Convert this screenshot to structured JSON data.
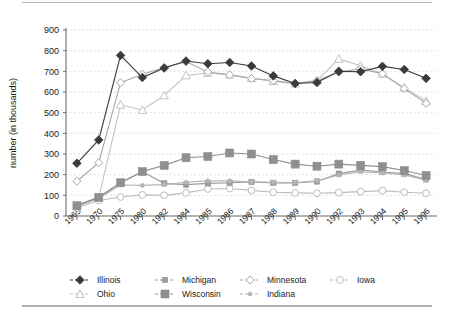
{
  "chart_data": {
    "type": "line",
    "title": "",
    "subtitle": "",
    "xlabel": "",
    "ylabel": "number (in thousands)",
    "ylim": [
      0,
      900
    ],
    "ytick_step": 100,
    "yticks": [
      0,
      100,
      200,
      300,
      400,
      500,
      600,
      700,
      800,
      900
    ],
    "grid": true,
    "grid_style": "dotted-horizontal",
    "legend_position": "bottom",
    "legend_columns": 4,
    "categories": [
      "1965",
      "1970",
      "1975",
      "1980",
      "1982",
      "1984",
      "1985",
      "1986",
      "1987",
      "1988",
      "1989",
      "1990",
      "1992",
      "1993",
      "1994",
      "1995",
      "1996"
    ],
    "series": [
      {
        "name": "Illinois",
        "marker": "filled-diamond",
        "color": "#3a3a3a",
        "values": [
          255,
          368,
          777,
          670,
          716,
          750,
          737,
          743,
          726,
          678,
          641,
          646,
          700,
          698,
          724,
          709,
          666
        ]
      },
      {
        "name": "Michigan",
        "marker": "small-filled-square",
        "color": "#9a9a9a",
        "values": [
          52,
          92,
          160,
          215,
          158,
          152,
          158,
          161,
          165,
          160,
          160,
          167,
          205,
          222,
          213,
          205,
          178
        ]
      },
      {
        "name": "Minnesota",
        "marker": "open-diamond",
        "color": "#a8a8a8",
        "values": [
          168,
          258,
          645,
          686,
          718,
          747,
          697,
          683,
          665,
          655,
          642,
          655,
          696,
          712,
          688,
          617,
          545
        ]
      },
      {
        "name": "Iowa",
        "marker": "open-circle",
        "color": "#bdbdbd",
        "values": [
          40,
          75,
          92,
          102,
          100,
          112,
          131,
          133,
          124,
          115,
          112,
          110,
          113,
          118,
          123,
          115,
          110
        ]
      },
      {
        "name": "Ohio",
        "marker": "open-triangle",
        "color": "#c2c2c2",
        "values": [
          45,
          88,
          538,
          513,
          583,
          680,
          692,
          683,
          667,
          652,
          640,
          655,
          760,
          727,
          688,
          620,
          556
        ]
      },
      {
        "name": "Wisconsin",
        "marker": "large-filled-square",
        "color": "#8f8f8f",
        "values": [
          50,
          90,
          161,
          215,
          245,
          282,
          288,
          305,
          300,
          273,
          251,
          241,
          251,
          245,
          239,
          220,
          196
        ]
      },
      {
        "name": "Indiana",
        "marker": "small-dot",
        "color": "#b5b5b5",
        "values": [
          48,
          85,
          150,
          148,
          152,
          163,
          170,
          170,
          166,
          163,
          162,
          170,
          198,
          214,
          208,
          200,
          172
        ]
      }
    ]
  },
  "axes": {
    "y_title": "number (in thousands)",
    "y_tick_labels": [
      "900",
      "800",
      "700",
      "600",
      "500",
      "400",
      "300",
      "200",
      "100",
      "0"
    ],
    "x_tick_labels": [
      "1965",
      "1970",
      "1975",
      "1980",
      "1982",
      "1984",
      "1985",
      "1986",
      "1987",
      "1988",
      "1989",
      "1990",
      "1992",
      "1993",
      "1994",
      "1995",
      "1996"
    ]
  },
  "legend": {
    "entries": [
      {
        "label": "Illinois",
        "marker": "filled-diamond",
        "color": "#3a3a3a"
      },
      {
        "label": "Michigan",
        "marker": "small-filled-square",
        "color": "#9a9a9a"
      },
      {
        "label": "Minnesota",
        "marker": "open-diamond",
        "color": "#a8a8a8"
      },
      {
        "label": "Iowa",
        "marker": "open-circle",
        "color": "#bdbdbd"
      },
      {
        "label": "Ohio",
        "marker": "open-triangle",
        "color": "#c2c2c2"
      },
      {
        "label": "Wisconsin",
        "marker": "large-filled-square",
        "color": "#8f8f8f"
      },
      {
        "label": "Indiana",
        "marker": "small-dot",
        "color": "#b5b5b5"
      }
    ]
  },
  "colors": {
    "background": "#ffffff",
    "axis": "#6e6e6e",
    "grid": "#cfcfcf",
    "text": "#1a1a1a"
  }
}
